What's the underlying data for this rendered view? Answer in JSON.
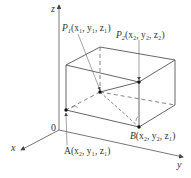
{
  "diagram": {
    "type": "3d-rectangular-box",
    "axes": {
      "x_label": "x",
      "y_label": "y",
      "z_label": "z",
      "origin_label": "0"
    },
    "points": {
      "P1": {
        "name": "P",
        "sub": "1",
        "coords": "(x₁, y₁, z₁)"
      },
      "P2": {
        "name": "P",
        "sub": "2",
        "coords": "(x₂, y₂, z₂)"
      },
      "A": {
        "name": "A",
        "coords": "(x₂, y₁, z₁)"
      },
      "B": {
        "name": "B",
        "coords": "(x₂, y₂, z₁)"
      }
    },
    "colors": {
      "line": "#555555",
      "text": "#333333",
      "point": "#111111"
    }
  }
}
